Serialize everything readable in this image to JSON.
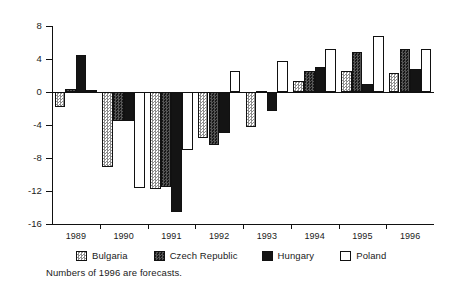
{
  "chart_data": {
    "type": "bar",
    "title": "",
    "subtitle": "",
    "xlabel": "",
    "ylabel": "",
    "categories": [
      "1989",
      "1990",
      "1991",
      "1992",
      "1993",
      "1994",
      "1995",
      "1996"
    ],
    "ylim": [
      -16,
      8
    ],
    "yticks": [
      8,
      4,
      0,
      -4,
      -8,
      -12,
      -16
    ],
    "ytick_labels": [
      "8",
      "4",
      "0",
      "-4",
      "-8",
      "-12",
      "-16"
    ],
    "grid": false,
    "legend_position": "bottom",
    "zero_line": true,
    "series": [
      {
        "name": "Bulgaria",
        "swatch": "light-checkered",
        "color": "#c9c9c9",
        "values": [
          -1.8,
          -9.1,
          -11.7,
          -5.6,
          -4.2,
          1.3,
          2.5,
          2.3
        ]
      },
      {
        "name": "Czech Republic",
        "swatch": "dark-dotted",
        "color": "#2b2b2b",
        "values": [
          0.4,
          -3.5,
          -11.5,
          -6.4,
          0.1,
          2.6,
          4.8,
          5.2
        ]
      },
      {
        "name": "Hungary",
        "swatch": "solid-black",
        "color": "#141414",
        "values": [
          4.5,
          -3.5,
          -14.5,
          -5.0,
          -2.3,
          3.0,
          1.0,
          2.8
        ]
      },
      {
        "name": "Poland",
        "swatch": "white",
        "color": "#ffffff",
        "values": [
          0.2,
          -11.6,
          -7.0,
          2.6,
          3.8,
          5.2,
          6.8,
          5.2
        ]
      }
    ],
    "annotations": [
      "Numbers of 1996 are forecasts."
    ]
  },
  "footnote": "Numbers of 1996 are forecasts.",
  "legend": {
    "items": [
      {
        "label": "Bulgaria"
      },
      {
        "label": "Czech Republic"
      },
      {
        "label": "Hungary"
      },
      {
        "label": "Poland"
      }
    ]
  }
}
